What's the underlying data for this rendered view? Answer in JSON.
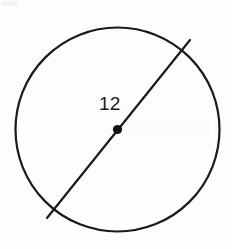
{
  "figure": {
    "background_color": "#fdfdfd",
    "stroke_color": "#1a1a1a",
    "label_color": "#1c1c1c",
    "width": 232,
    "height": 249
  },
  "diagram": {
    "type": "geometry",
    "shape": "circle",
    "circle": {
      "center_x": 117.5,
      "center_y": 129.5,
      "radius": 102,
      "stroke_width": 2.2,
      "fill": "none"
    },
    "center_point": {
      "cx": 117.5,
      "cy": 129.5,
      "r": 4.6,
      "fill": "#111111"
    },
    "diameter_segment": {
      "x1": 47,
      "y1": 218,
      "x2": 190,
      "y2": 40,
      "stroke_width": 2.2
    },
    "labels": {
      "diameter": "12"
    }
  },
  "chart_data": {
    "type": "diagram",
    "elements": [
      {
        "name": "circle",
        "center": [
          117.5,
          129.5
        ],
        "radius": 102
      },
      {
        "name": "center-point",
        "position": [
          117.5,
          129.5
        ]
      },
      {
        "name": "diameter-line",
        "from": [
          47,
          218
        ],
        "to": [
          190,
          40
        ],
        "label": "12"
      }
    ],
    "annotations": [
      {
        "text": "12",
        "x": 109,
        "y": 104,
        "refers_to": "diameter-line"
      }
    ]
  }
}
